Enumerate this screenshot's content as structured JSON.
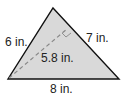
{
  "diagram": {
    "type": "triangle",
    "fill": "#d9d9d9",
    "stroke": "#111111",
    "labels": {
      "left_side": "6 in.",
      "right_side": "7 in.",
      "base": "8 in.",
      "altitude": "5.8 in."
    }
  }
}
